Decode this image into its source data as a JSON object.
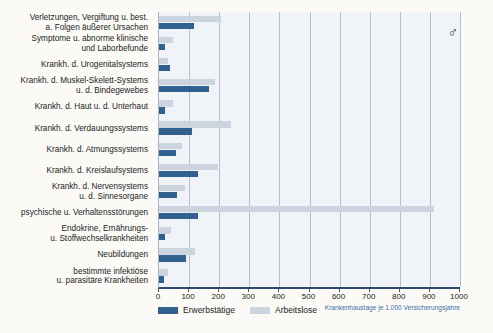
{
  "chart_data": {
    "type": "bar",
    "orientation": "horizontal",
    "gender_symbol": "♂",
    "xlabel": "Krankenhaustage je 1.000 Versicherungsjahre",
    "xlim": [
      0,
      1000
    ],
    "xticks": [
      0,
      100,
      200,
      300,
      400,
      500,
      600,
      700,
      800,
      900,
      1000
    ],
    "grid": true,
    "legend_position": "bottom-left",
    "categories": [
      [
        "Verletzungen, Vergiftung u. best.",
        "a. Folgen äußerer Ursachen"
      ],
      [
        "Symptome u. abnorme klinische",
        "und Laborbefunde"
      ],
      [
        "Krankh. d. Urogenitalsystems"
      ],
      [
        "Krankh. d. Muskel-Skelett-Systems",
        "u. d. Bindegewebes"
      ],
      [
        "Krankh. d. Haut u. d. Unterhaut"
      ],
      [
        "Krankh. d. Verdauungssystems"
      ],
      [
        "Krankh. d. Atmungssystems"
      ],
      [
        "Krankh. d. Kreislaufsystems"
      ],
      [
        "Krankh. d. Nervensystems",
        "u. d. Sinnesorgane"
      ],
      [
        "psychische u. Verhaltensstörungen"
      ],
      [
        "Endokrine, Ernährungs-",
        "u. Stoffwechselkrankheiten"
      ],
      [
        "Neubildungen"
      ],
      [
        "bestimmte infektiöse",
        "u. parasitäre Krankheiten"
      ]
    ],
    "series": [
      {
        "name": "Erwerbstätige",
        "color": "#30618f",
        "values": [
          115,
          20,
          35,
          165,
          20,
          110,
          55,
          130,
          60,
          130,
          20,
          90,
          15
        ]
      },
      {
        "name": "Arbeitslose",
        "color": "#ccd4e0",
        "values": [
          205,
          45,
          30,
          185,
          45,
          240,
          75,
          195,
          85,
          915,
          40,
          120,
          30
        ]
      }
    ]
  },
  "colors": {
    "page_bg": "#fbfaf7",
    "plot_bg": "#f0f4f9",
    "gridline": "#b7bfcb",
    "axis_line": "#2c4a6e",
    "xlabel_text": "#3a6ea5"
  }
}
